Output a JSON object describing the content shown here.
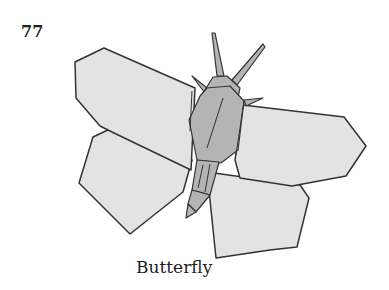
{
  "page": {
    "number": "77",
    "caption": "Butterfly"
  },
  "figure": {
    "colors": {
      "wing_fill": "#e3e3e3",
      "body_fill": "#b4b4b4",
      "body_dark": "#a0a0a0",
      "outline": "#333333",
      "background": "#ffffff"
    }
  }
}
